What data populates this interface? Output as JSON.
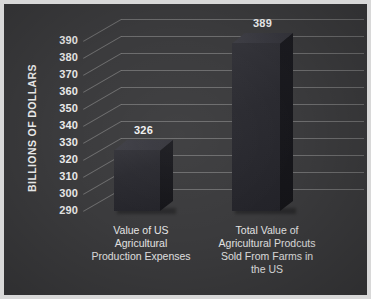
{
  "chart_data": {
    "type": "bar",
    "title": "",
    "subtitle": "",
    "xlabel": "",
    "ylabel": "BILLIONS OF DOLLARS",
    "categories": [
      "Value of US Agricultural Production Expenses",
      "Total Value of Agricultural Prodcuts Sold From Farms in the US"
    ],
    "category_lines": [
      [
        "Value of US",
        "Agricultural",
        "Production Expenses"
      ],
      [
        "Total Value of",
        "Agricultural Prodcuts",
        "Sold From Farms in",
        "the US"
      ]
    ],
    "values": [
      326,
      389
    ],
    "value_labels": [
      "326",
      "389"
    ],
    "ylim": [
      290,
      390
    ],
    "ytick_labels": [
      "390",
      "380",
      "370",
      "360",
      "350",
      "340",
      "330",
      "320",
      "310",
      "300",
      "290"
    ],
    "ytick_values": [
      390,
      380,
      370,
      360,
      350,
      340,
      330,
      320,
      310,
      300,
      290
    ],
    "grid": true,
    "legend": null,
    "legend_position": "none",
    "style": "3d-bar",
    "colors": {
      "background": "#3b3b3d",
      "frame": "#d8d8d8",
      "bar_front": "#2b2b31",
      "bar_side": "#17171c",
      "bar_top": "#3a3a41",
      "gridline": "#8d8d8d",
      "text": "#eaeaea"
    }
  }
}
